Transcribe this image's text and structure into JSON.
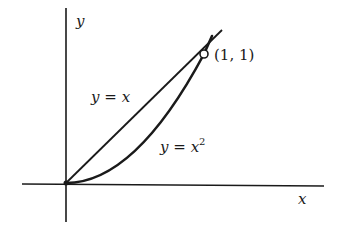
{
  "diagram": {
    "axes": {
      "x_label": "x",
      "y_label": "y"
    },
    "curves": [
      {
        "name": "line",
        "label_lhs": "y",
        "label_eq": "=",
        "label_rhs": "x",
        "equation": "y = x"
      },
      {
        "name": "parabola",
        "label_lhs": "y",
        "label_eq": "=",
        "label_rhs": "x",
        "label_exp": "2",
        "equation": "y = x^2"
      }
    ],
    "intersection_point": {
      "label": "(1, 1)",
      "x": 1,
      "y": 1
    },
    "colors": {
      "ink": "#1a1a1a",
      "background": "#ffffff"
    }
  }
}
